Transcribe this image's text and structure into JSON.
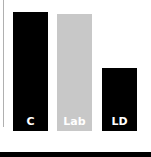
{
  "chart_data": {
    "type": "bar",
    "title": "",
    "xlabel": "",
    "ylabel": "",
    "categories": [
      "C",
      "Lab",
      "LD"
    ],
    "values": [
      100,
      98,
      53
    ],
    "colors": [
      "#000000",
      "#c8c8c8",
      "#000000"
    ],
    "label_color": "#ffffff",
    "ylim": [
      0,
      100
    ],
    "grid": false,
    "legend": "none",
    "value_note": "relative heights estimated from pixels; no axis ticks shown"
  },
  "bars": [
    {
      "label": "C",
      "color": "#000000",
      "height_px": 119,
      "left_px": 13
    },
    {
      "label": "Lab",
      "color": "#c8c8c8",
      "height_px": 117,
      "left_px": 57
    },
    {
      "label": "LD",
      "color": "#000000",
      "height_px": 63,
      "left_px": 102
    }
  ]
}
